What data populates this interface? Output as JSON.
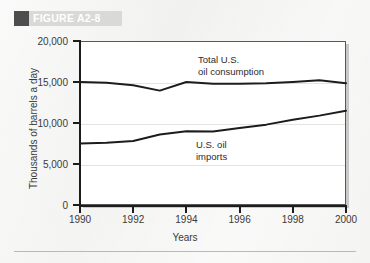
{
  "figure": {
    "label": "FIGURE A2-8",
    "marker_color": "#4d4d4d",
    "band_color": "#d9d9d7"
  },
  "page": {
    "background_color": "#f2f2f1",
    "rule_color": "#b9b9b7"
  },
  "chart_data": {
    "type": "line",
    "title": "",
    "xlabel": "Years",
    "ylabel": "Thousands of barrels a day",
    "xlim": [
      1990,
      2000
    ],
    "ylim": [
      0,
      20000
    ],
    "xticks": [
      1990,
      1992,
      1994,
      1996,
      1998,
      2000
    ],
    "xtick_labels": [
      "1990",
      "1992",
      "1994",
      "1996",
      "1998",
      "2000"
    ],
    "yticks": [
      0,
      5000,
      10000,
      15000,
      20000
    ],
    "ytick_labels": [
      "0",
      "5,000",
      "10,000",
      "15,000",
      "20,000"
    ],
    "grid": true,
    "legend_position": "inline-annotation",
    "line_color": "#1c1c1c",
    "x": [
      1990,
      1991,
      1992,
      1993,
      1994,
      1995,
      1996,
      1997,
      1998,
      1999,
      2000
    ],
    "series": [
      {
        "name": "Total U.S. oil consumption",
        "annotation": "Total U.S.\noil consumption",
        "values": [
          15000,
          14900,
          14600,
          13950,
          15000,
          14800,
          14800,
          14850,
          15000,
          15200,
          14850
        ]
      },
      {
        "name": "U.S. oil imports",
        "annotation": "U.S. oil\nimports",
        "values": [
          7500,
          7600,
          7800,
          8600,
          9000,
          8950,
          9400,
          9800,
          10400,
          10900,
          11500
        ]
      }
    ]
  }
}
